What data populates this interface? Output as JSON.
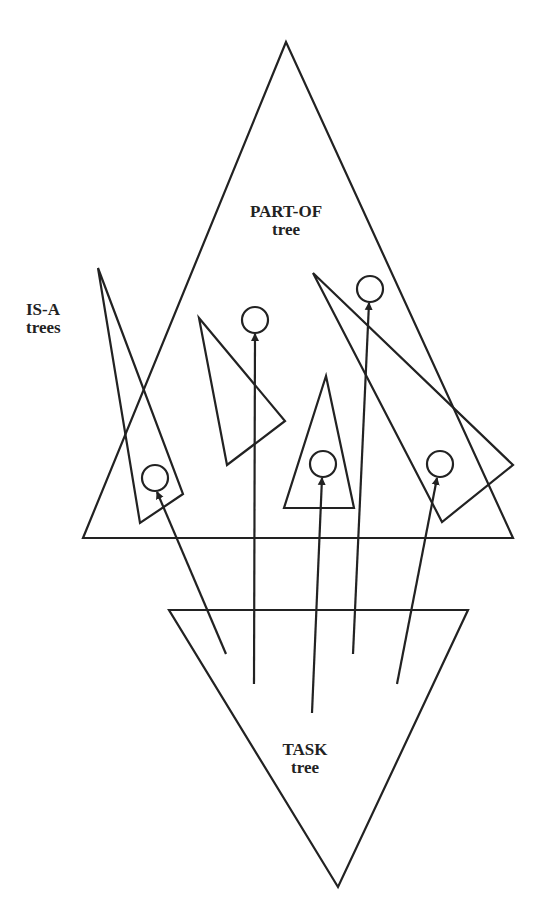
{
  "diagram": {
    "stroke_color": "#222222",
    "background": "#ffffff",
    "labels": {
      "part_of": {
        "line1": "PART-OF",
        "line2": "tree"
      },
      "is_a": {
        "line1": "IS-A",
        "line2": "trees"
      },
      "task": {
        "line1": "TASK",
        "line2": "tree"
      }
    },
    "shapes": {
      "part_of_tree": {
        "type": "triangle-up",
        "points": [
          [
            286,
            42
          ],
          [
            83,
            538
          ],
          [
            513,
            538
          ]
        ]
      },
      "task_tree": {
        "type": "triangle-down",
        "points": [
          [
            169,
            610
          ],
          [
            468,
            610
          ],
          [
            338,
            887
          ]
        ]
      },
      "is_a_trees": [
        {
          "points": [
            [
              98,
              268
            ],
            [
              183,
              494
            ],
            [
              140,
              523
            ]
          ],
          "node": [
            155,
            478
          ]
        },
        {
          "points": [
            [
              199,
              318
            ],
            [
              285,
              421
            ],
            [
              227,
              465
            ]
          ],
          "node": null
        },
        {
          "points": [
            [
              326,
              376
            ],
            [
              354,
              508
            ],
            [
              284,
              508
            ]
          ],
          "node": [
            323,
            464
          ]
        },
        {
          "points": [
            [
              313,
              273
            ],
            [
              513,
              465
            ],
            [
              442,
              522
            ]
          ],
          "node": [
            440,
            464
          ]
        }
      ],
      "part_nodes": [
        [
          255,
          320
        ],
        [
          370,
          289
        ]
      ],
      "arrows": [
        {
          "from": [
            226,
            654
          ],
          "to": [
            155,
            492
          ]
        },
        {
          "from": [
            254,
            684
          ],
          "to": [
            255,
            334
          ]
        },
        {
          "from": [
            312,
            713
          ],
          "to": [
            323,
            478
          ]
        },
        {
          "from": [
            353,
            654
          ],
          "to": [
            369,
            303
          ]
        },
        {
          "from": [
            397,
            684
          ],
          "to": [
            437,
            478
          ]
        }
      ]
    }
  }
}
